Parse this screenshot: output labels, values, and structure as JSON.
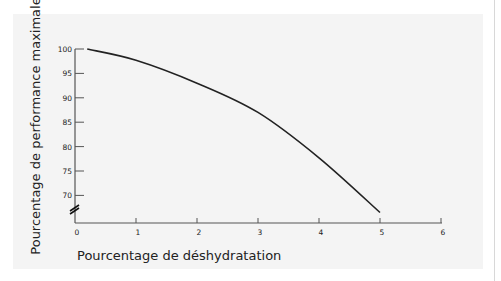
{
  "chart_data": {
    "type": "line",
    "title": "",
    "xlabel": "Pourcentage de déshydratation",
    "ylabel": "Pourcentage de performance maximale",
    "x_ticks": [
      0,
      1,
      2,
      3,
      4,
      5,
      6
    ],
    "y_ticks": [
      70,
      75,
      80,
      85,
      90,
      95,
      100
    ],
    "xlim": [
      0,
      6
    ],
    "ylim": [
      70,
      100
    ],
    "y_axis_break": true,
    "grid": false,
    "legend": null,
    "series": [
      {
        "name": "Performance",
        "x": [
          0.2,
          1,
          2,
          3,
          4,
          5
        ],
        "values": [
          100,
          97.7,
          93,
          87,
          77.7,
          66.5
        ]
      }
    ]
  },
  "colors": {
    "panel": "#f4f4f4",
    "axis": "#555555",
    "line": "#222222",
    "text": "#222222"
  }
}
